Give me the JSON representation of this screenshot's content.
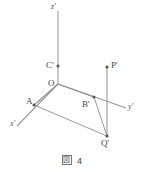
{
  "figure": {
    "caption_symbol": "図",
    "caption_number": "4",
    "stroke_color": "#8a8a8a",
    "label_color": "#444444",
    "background": "#ffffff"
  },
  "axes": [
    {
      "name": "z-prime",
      "label": "z'",
      "direction": "up"
    },
    {
      "name": "y-prime",
      "label": "y'",
      "direction": "right-down"
    },
    {
      "name": "x-prime",
      "label": "x'",
      "direction": "left-down"
    }
  ],
  "points": [
    {
      "name": "O",
      "label": "O",
      "role": "origin"
    },
    {
      "name": "C-prime",
      "label": "C'",
      "role": "point-on-z-axis"
    },
    {
      "name": "A",
      "label": "A",
      "role": "point-on-x-axis"
    },
    {
      "name": "B-prime",
      "label": "B'",
      "role": "point-on-y-axis"
    },
    {
      "name": "P-prime",
      "label": "P'",
      "role": "point-above-y-axis"
    },
    {
      "name": "Q-prime",
      "label": "Q'",
      "role": "point-below-y-axis"
    }
  ],
  "segments": [
    {
      "name": "segment-O-A"
    },
    {
      "name": "segment-A-Q-prime"
    },
    {
      "name": "segment-O-B-prime"
    },
    {
      "name": "segment-B-prime-Q-prime"
    },
    {
      "name": "segment-P-prime-Q-prime"
    }
  ]
}
